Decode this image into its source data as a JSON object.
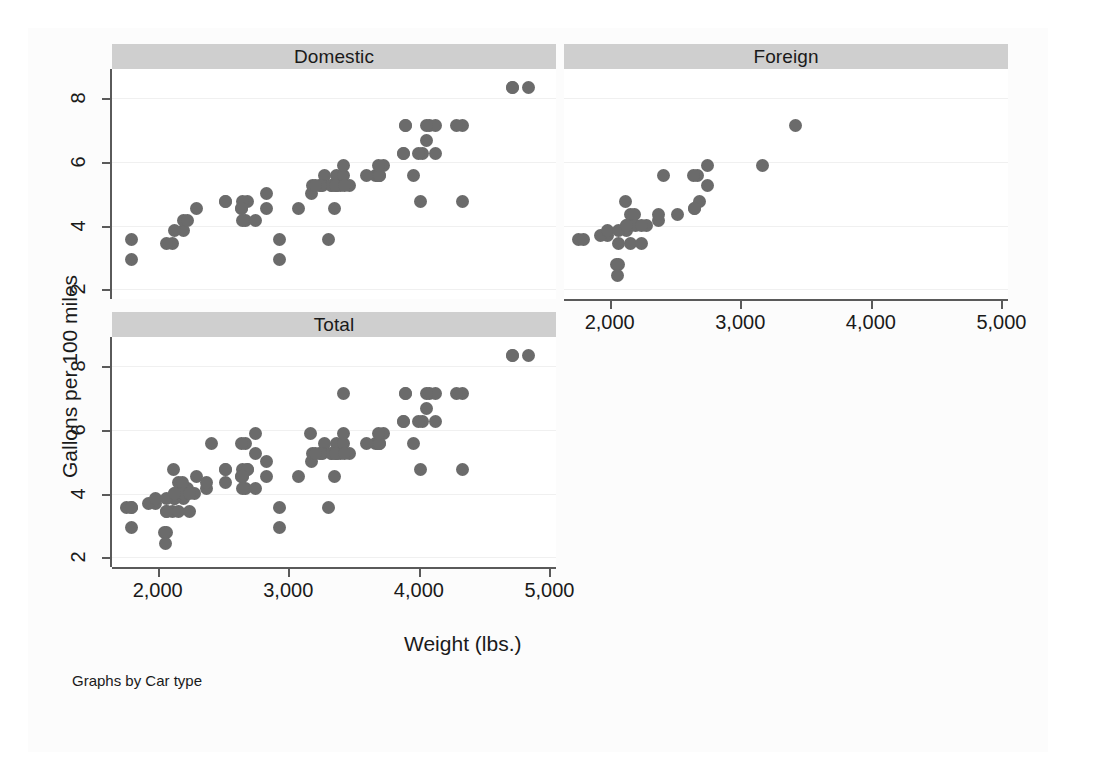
{
  "figure": {
    "ylabel": "Gallons per 100 miles",
    "xlabel": "Weight (lbs.)",
    "note": "Graphs by Car type",
    "marker_color": "#6b6b6b",
    "panel_title_bg": "#cfcfcf",
    "axis_color": "#5a5a5a",
    "grid_color": "#f0f0f0",
    "background": "#fcfcfc"
  },
  "chart_data": {
    "type": "scatter",
    "title": "",
    "xlabel": "Weight (lbs.)",
    "ylabel": "Gallons per 100 miles",
    "xlim": [
      1650,
      5050
    ],
    "ylim": [
      1.7,
      8.9
    ],
    "xticks": [
      2000,
      3000,
      4000,
      5000
    ],
    "xticklabels": [
      "2,000",
      "3,000",
      "4,000",
      "5,000"
    ],
    "yticks": [
      2,
      4,
      6,
      8
    ],
    "yticklabels": [
      "2",
      "4",
      "6",
      "8"
    ],
    "grid": "horizontal",
    "legend": "none",
    "note": "Graphs by Car type",
    "panels": [
      {
        "name": "Domestic",
        "label": "Domestic",
        "position": "top-left",
        "points": [
          [
            2930,
            3.57
          ],
          [
            2930,
            2.94
          ],
          [
            3350,
            4.55
          ],
          [
            2640,
            4.55
          ],
          [
            3250,
            5.26
          ],
          [
            4080,
            7.14
          ],
          [
            3670,
            5.56
          ],
          [
            3690,
            5.56
          ],
          [
            3180,
            5.0
          ],
          [
            3880,
            6.25
          ],
          [
            4330,
            7.14
          ],
          [
            3900,
            7.14
          ],
          [
            4290,
            7.14
          ],
          [
            3730,
            5.88
          ],
          [
            3470,
            5.26
          ],
          [
            2110,
            3.45
          ],
          [
            2200,
            3.85
          ],
          [
            2670,
            4.17
          ],
          [
            3700,
            5.56
          ],
          [
            3690,
            5.56
          ],
          [
            3400,
            5.26
          ],
          [
            3330,
            5.26
          ],
          [
            3370,
            5.26
          ],
          [
            2830,
            4.55
          ],
          [
            3370,
            5.56
          ],
          [
            3080,
            4.55
          ],
          [
            4130,
            7.14
          ],
          [
            4060,
            6.67
          ],
          [
            4720,
            8.33
          ],
          [
            3310,
            3.57
          ],
          [
            3370,
            5.26
          ],
          [
            2200,
            4.17
          ],
          [
            2520,
            4.76
          ],
          [
            2300,
            4.55
          ],
          [
            2230,
            4.17
          ],
          [
            2690,
            4.76
          ],
          [
            3280,
            5.56
          ],
          [
            3880,
            6.25
          ],
          [
            3900,
            7.14
          ],
          [
            4030,
            6.25
          ],
          [
            3260,
            5.26
          ],
          [
            3600,
            5.56
          ],
          [
            3330,
            5.26
          ],
          [
            3420,
            5.56
          ],
          [
            3995,
            6.25
          ],
          [
            4010,
            4.76
          ],
          [
            4060,
            7.14
          ],
          [
            4130,
            6.25
          ],
          [
            4840,
            8.33
          ],
          [
            4720,
            8.33
          ],
          [
            3360,
            5.26
          ],
          [
            2750,
            4.17
          ],
          [
            2130,
            3.85
          ],
          [
            2650,
            4.76
          ],
          [
            1800,
            3.57
          ],
          [
            1800,
            2.94
          ],
          [
            3420,
            5.88
          ],
          [
            3955,
            5.56
          ],
          [
            4330,
            4.76
          ],
          [
            3185,
            5.26
          ],
          [
            2070,
            3.45
          ],
          [
            2650,
            4.17
          ],
          [
            3700,
            5.56
          ],
          [
            3690,
            5.88
          ],
          [
            3430,
            5.26
          ],
          [
            2640,
            4.55
          ],
          [
            2830,
            5.0
          ],
          [
            2520,
            4.76
          ],
          [
            3250,
            5.26
          ],
          [
            3210,
            5.26
          ]
        ]
      },
      {
        "name": "Foreign",
        "label": "Foreign",
        "position": "top-right",
        "points": [
          [
            2070,
            3.45
          ],
          [
            2130,
            3.85
          ],
          [
            2650,
            4.55
          ],
          [
            1760,
            3.57
          ],
          [
            2070,
            2.78
          ],
          [
            2160,
            4.35
          ],
          [
            2670,
            5.56
          ],
          [
            2750,
            5.88
          ],
          [
            1980,
            3.7
          ],
          [
            2160,
            4.0
          ],
          [
            2370,
            4.17
          ],
          [
            2280,
            4.0
          ],
          [
            2130,
            4.0
          ],
          [
            2050,
            2.78
          ],
          [
            2190,
            4.35
          ],
          [
            2120,
            4.76
          ],
          [
            2410,
            5.56
          ],
          [
            2520,
            4.35
          ],
          [
            2200,
            4.0
          ],
          [
            2060,
            2.44
          ],
          [
            1930,
            3.7
          ],
          [
            3420,
            7.14
          ],
          [
            2690,
            4.76
          ],
          [
            2640,
            5.56
          ],
          [
            3170,
            5.88
          ],
          [
            1800,
            3.57
          ],
          [
            2650,
            4.55
          ],
          [
            2240,
            4.0
          ],
          [
            2160,
            3.45
          ],
          [
            2370,
            4.35
          ],
          [
            1980,
            3.85
          ],
          [
            2070,
            3.85
          ],
          [
            2130,
            4.0
          ],
          [
            2750,
            5.26
          ],
          [
            2240,
            3.45
          ]
        ]
      },
      {
        "name": "Total",
        "label": "Total",
        "position": "bottom-left",
        "points": [
          [
            2930,
            3.57
          ],
          [
            2930,
            2.94
          ],
          [
            3350,
            4.55
          ],
          [
            2640,
            4.55
          ],
          [
            3250,
            5.26
          ],
          [
            4080,
            7.14
          ],
          [
            3670,
            5.56
          ],
          [
            3690,
            5.56
          ],
          [
            3180,
            5.0
          ],
          [
            3880,
            6.25
          ],
          [
            4330,
            7.14
          ],
          [
            3900,
            7.14
          ],
          [
            4290,
            7.14
          ],
          [
            3730,
            5.88
          ],
          [
            3470,
            5.26
          ],
          [
            2110,
            3.45
          ],
          [
            2200,
            3.85
          ],
          [
            2670,
            4.17
          ],
          [
            3700,
            5.56
          ],
          [
            3690,
            5.56
          ],
          [
            3400,
            5.26
          ],
          [
            3330,
            5.26
          ],
          [
            3370,
            5.26
          ],
          [
            2830,
            4.55
          ],
          [
            3370,
            5.56
          ],
          [
            3080,
            4.55
          ],
          [
            4130,
            7.14
          ],
          [
            4060,
            6.67
          ],
          [
            4720,
            8.33
          ],
          [
            3310,
            3.57
          ],
          [
            3370,
            5.26
          ],
          [
            2200,
            4.17
          ],
          [
            2520,
            4.76
          ],
          [
            2300,
            4.55
          ],
          [
            2230,
            4.17
          ],
          [
            2690,
            4.76
          ],
          [
            3280,
            5.56
          ],
          [
            3880,
            6.25
          ],
          [
            3900,
            7.14
          ],
          [
            4030,
            6.25
          ],
          [
            3260,
            5.26
          ],
          [
            3600,
            5.56
          ],
          [
            3330,
            5.26
          ],
          [
            3420,
            5.56
          ],
          [
            3995,
            6.25
          ],
          [
            4010,
            4.76
          ],
          [
            4060,
            7.14
          ],
          [
            4130,
            6.25
          ],
          [
            4840,
            8.33
          ],
          [
            4720,
            8.33
          ],
          [
            3360,
            5.26
          ],
          [
            2750,
            4.17
          ],
          [
            2130,
            3.85
          ],
          [
            2650,
            4.76
          ],
          [
            1800,
            3.57
          ],
          [
            1800,
            2.94
          ],
          [
            3420,
            5.88
          ],
          [
            3955,
            5.56
          ],
          [
            4330,
            4.76
          ],
          [
            3185,
            5.26
          ],
          [
            2070,
            3.45
          ],
          [
            2650,
            4.17
          ],
          [
            3700,
            5.56
          ],
          [
            3690,
            5.88
          ],
          [
            3430,
            5.26
          ],
          [
            2640,
            4.55
          ],
          [
            2830,
            5.0
          ],
          [
            2520,
            4.76
          ],
          [
            3250,
            5.26
          ],
          [
            3210,
            5.26
          ],
          [
            2070,
            3.45
          ],
          [
            2130,
            3.85
          ],
          [
            2650,
            4.55
          ],
          [
            1760,
            3.57
          ],
          [
            2070,
            2.78
          ],
          [
            2160,
            4.35
          ],
          [
            2670,
            5.56
          ],
          [
            2750,
            5.88
          ],
          [
            1980,
            3.7
          ],
          [
            2160,
            4.0
          ],
          [
            2370,
            4.17
          ],
          [
            2280,
            4.0
          ],
          [
            2130,
            4.0
          ],
          [
            2050,
            2.78
          ],
          [
            2190,
            4.35
          ],
          [
            2120,
            4.76
          ],
          [
            2410,
            5.56
          ],
          [
            2520,
            4.35
          ],
          [
            2200,
            4.0
          ],
          [
            2060,
            2.44
          ],
          [
            1930,
            3.7
          ],
          [
            3420,
            7.14
          ],
          [
            2690,
            4.76
          ],
          [
            2640,
            5.56
          ],
          [
            3170,
            5.88
          ],
          [
            1800,
            3.57
          ],
          [
            2650,
            4.55
          ],
          [
            2240,
            4.0
          ],
          [
            2160,
            3.45
          ],
          [
            2370,
            4.35
          ],
          [
            1980,
            3.85
          ],
          [
            2070,
            3.85
          ],
          [
            2130,
            4.0
          ],
          [
            2750,
            5.26
          ],
          [
            2240,
            3.45
          ]
        ]
      }
    ]
  }
}
